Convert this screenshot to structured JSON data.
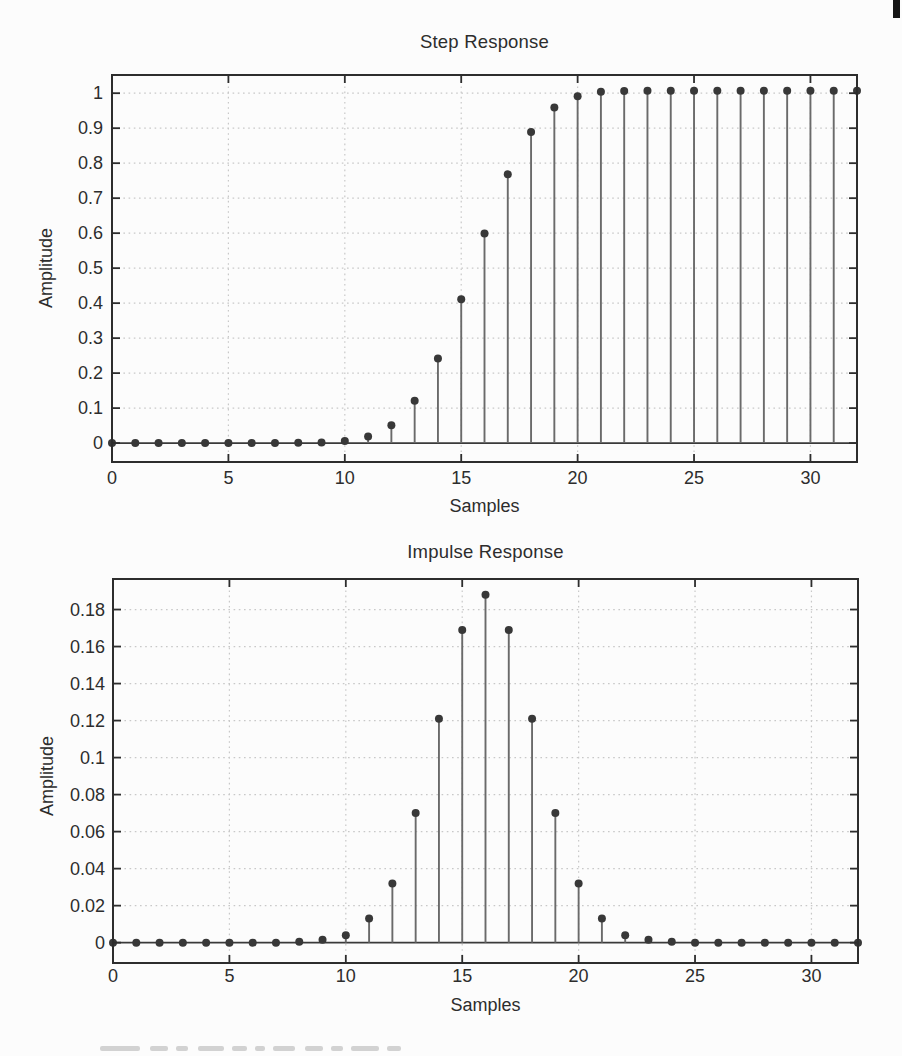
{
  "page": {
    "background_color": "#fcfcfc",
    "corner_mark_color": "#161616"
  },
  "colors": {
    "marker": "#383838",
    "stem": "#6a6a6a",
    "axis": "#2d2d2d",
    "baseline": "#3a3a3a",
    "grid": "#c8c8c8",
    "text": "#2d2d2d"
  },
  "chart_data": [
    {
      "type": "stem",
      "title": "Step Response",
      "xlabel": "Samples",
      "ylabel": "Amplitude",
      "xlim": [
        0,
        32
      ],
      "ylim": [
        -0.054,
        1.052
      ],
      "grid": true,
      "xticks": [
        0,
        5,
        10,
        15,
        20,
        25,
        30
      ],
      "xtick_labels": [
        "0",
        "5",
        "10",
        "15",
        "20",
        "25",
        "30"
      ],
      "yticks": [
        0,
        0.1,
        0.2,
        0.3,
        0.4,
        0.5,
        0.6,
        0.7,
        0.8,
        0.9,
        1
      ],
      "ytick_labels": [
        "0",
        "0.1",
        "0.2",
        "0.3",
        "0.4",
        "0.5",
        "0.6",
        "0.7",
        "0.8",
        "0.9",
        "1"
      ],
      "x": [
        0,
        1,
        2,
        3,
        4,
        5,
        6,
        7,
        8,
        9,
        10,
        11,
        12,
        13,
        14,
        15,
        16,
        17,
        18,
        19,
        20,
        21,
        22,
        23,
        24,
        25,
        26,
        27,
        28,
        29,
        30,
        31,
        32
      ],
      "values": [
        0,
        0,
        0,
        0,
        0,
        0,
        0,
        0,
        0.001,
        0.002,
        0.006,
        0.019,
        0.051,
        0.121,
        0.242,
        0.411,
        0.599,
        0.768,
        0.889,
        0.959,
        0.991,
        1.004,
        1.006,
        1.007,
        1.007,
        1.007,
        1.007,
        1.007,
        1.007,
        1.007,
        1.007,
        1.007,
        1.007
      ]
    },
    {
      "type": "stem",
      "title": "Impulse Response",
      "xlabel": "Samples",
      "ylabel": "Amplitude",
      "xlim": [
        0,
        32
      ],
      "ylim": [
        -0.011,
        0.1965
      ],
      "grid": true,
      "xticks": [
        0,
        5,
        10,
        15,
        20,
        25,
        30
      ],
      "xtick_labels": [
        "0",
        "5",
        "10",
        "15",
        "20",
        "25",
        "30"
      ],
      "yticks": [
        0,
        0.02,
        0.04,
        0.06,
        0.08,
        0.1,
        0.12,
        0.14,
        0.16,
        0.18
      ],
      "ytick_labels": [
        "0",
        "0.02",
        "0.04",
        "0.06",
        "0.08",
        "0.1",
        "0.12",
        "0.14",
        "0.16",
        "0.18"
      ],
      "x": [
        0,
        1,
        2,
        3,
        4,
        5,
        6,
        7,
        8,
        9,
        10,
        11,
        12,
        13,
        14,
        15,
        16,
        17,
        18,
        19,
        20,
        21,
        22,
        23,
        24,
        25,
        26,
        27,
        28,
        29,
        30,
        31,
        32
      ],
      "values": [
        0,
        0,
        0,
        0,
        0,
        0,
        0,
        0,
        0.0005,
        0.0015,
        0.004,
        0.013,
        0.032,
        0.07,
        0.121,
        0.169,
        0.188,
        0.169,
        0.121,
        0.07,
        0.032,
        0.013,
        0.004,
        0.0015,
        0.0005,
        0,
        0,
        0,
        0,
        0,
        0,
        0,
        0
      ]
    }
  ]
}
